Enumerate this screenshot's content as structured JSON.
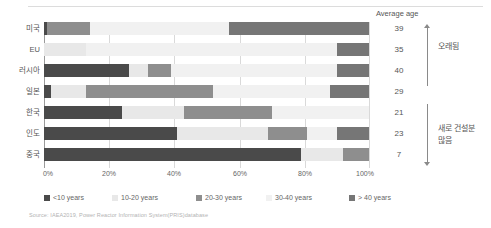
{
  "chart_data": {
    "type": "bar",
    "orientation": "horizontal",
    "stacked": true,
    "stacked_normalized": true,
    "title": "",
    "xlabel": "",
    "ylabel": "",
    "xlim": [
      0,
      100
    ],
    "xticks": [
      0,
      20,
      40,
      60,
      80,
      100
    ],
    "xticklabels": [
      "0%",
      "20%",
      "40%",
      "60%",
      "80%",
      "100%"
    ],
    "grid": true,
    "legend_position": "bottom",
    "categories": [
      "미국",
      "EU",
      "러시아",
      "일본",
      "한국",
      "인도",
      "중국"
    ],
    "series": [
      {
        "name": "<10 years",
        "color": "#4a4a4a",
        "values": [
          1,
          0,
          26,
          2,
          24,
          41,
          79
        ]
      },
      {
        "name": "10-20 years",
        "color": "#e8e8e8",
        "values": [
          0,
          13,
          6,
          11,
          19,
          28,
          13
        ]
      },
      {
        "name": "20-30 years",
        "color": "#8e8e8e",
        "values": [
          13,
          0,
          7,
          39,
          27,
          12,
          8
        ]
      },
      {
        "name": "30-40 years",
        "color": "#f1f1f1",
        "values": [
          43,
          77,
          51,
          36,
          30,
          9,
          0
        ]
      },
      {
        "name": "> 40 years",
        "color": "#767676",
        "values": [
          43,
          10,
          10,
          12,
          0,
          10,
          0
        ]
      }
    ],
    "legend": [
      {
        "label": "<10 years",
        "swatch": "#4a4a4a"
      },
      {
        "label": "10-20 years",
        "swatch": "#e8e8e8"
      },
      {
        "label": "20-30 years",
        "swatch": "#8e8e8e"
      },
      {
        "label": "30-40 years",
        "swatch": "#f1f1f1"
      },
      {
        "label": "> 40 years",
        "swatch": "#767676"
      }
    ],
    "annotations": {
      "average_age_header": "Average age",
      "average_age_values": [
        39,
        35,
        40,
        29,
        21,
        23,
        7
      ],
      "bracket_top_label": "오래됨",
      "bracket_bottom_label_line1": "새로 건설분",
      "bracket_bottom_label_line2": "많음"
    },
    "source": "Source: IAEA2019, Power Reactor Information System(PRIS)database"
  }
}
